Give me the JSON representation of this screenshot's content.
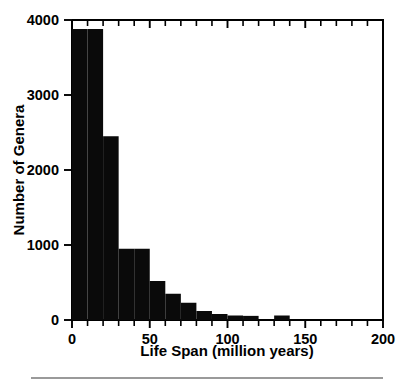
{
  "chart_data": {
    "type": "bar",
    "title": "",
    "subtitle": "",
    "xlabel": "Life Span (million years)",
    "ylabel": "Number of Genera",
    "xlim": [
      0,
      200
    ],
    "ylim": [
      0,
      4000
    ],
    "bin_width": 10,
    "grid": false,
    "legend": null,
    "legend_position": "none",
    "bar_color": "#0a0a0a",
    "axis_color": "#000000",
    "background_color": "#ffffff",
    "xticks_major": [
      0,
      50,
      100,
      150,
      200
    ],
    "xticklabels": [
      "0",
      "50",
      "100",
      "150",
      "200"
    ],
    "xticks_minor": [
      10,
      20,
      30,
      40,
      60,
      70,
      80,
      90,
      110,
      120,
      130,
      140,
      160,
      170,
      180,
      190
    ],
    "yticks": [
      0,
      1000,
      2000,
      3000,
      4000
    ],
    "yticklabels": [
      "0",
      "1000",
      "2000",
      "3000",
      "4000"
    ],
    "categories": [
      "0-10",
      "10-20",
      "20-30",
      "30-40",
      "40-50",
      "50-60",
      "60-70",
      "70-80",
      "80-90",
      "90-100",
      "100-110",
      "110-120",
      "120-130",
      "130-140",
      "140-150",
      "150-160",
      "160-170",
      "170-180",
      "180-190",
      "190-200"
    ],
    "bin_starts": [
      0,
      10,
      20,
      30,
      40,
      50,
      60,
      70,
      80,
      90,
      100,
      110,
      120,
      130,
      140,
      150,
      160,
      170,
      180,
      190
    ],
    "values": [
      3880,
      3880,
      2450,
      950,
      950,
      520,
      350,
      230,
      120,
      80,
      60,
      55,
      0,
      60,
      0,
      0,
      0,
      0,
      0,
      0
    ]
  },
  "figure": {
    "footer_rule": "horizontal-rule"
  }
}
